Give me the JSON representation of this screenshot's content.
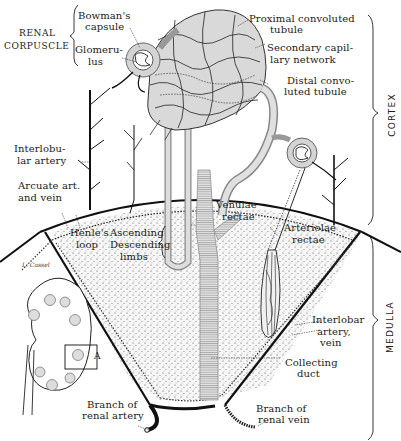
{
  "figure": {
    "labels": {
      "renal_corpuscle_1": "RENAL",
      "renal_corpuscle_2": "CORPUSCLE",
      "bowmans_capsule_1": "Bowman's",
      "bowmans_capsule_2": "capsule",
      "glomerulus_1": "Glomeru-",
      "glomerulus_2": "lus",
      "proximal_1": "Proximal convoluted",
      "proximal_2": "tubule",
      "secondary_1": "Secondary capil-",
      "secondary_2": "lary network",
      "distal_1": "Distal convo-",
      "distal_2": "luted tubule",
      "interlobular_1": "Interlobu-",
      "interlobular_2": "lar artery",
      "arcuate_1": "Arcuate art.",
      "arcuate_2": "and vein",
      "henles_1": "Henle's",
      "henles_2": "loop",
      "ascending": "Ascending",
      "descending": "Descending",
      "limbs": "limbs",
      "venulae_1": "Venulae",
      "venulae_2": "rectae",
      "arteriolae_1": "Arteriolae",
      "arteriolae_2": "rectae",
      "interlobar_1": "Interlobar",
      "interlobar_2": "artery,",
      "interlobar_3": "vein",
      "collecting_1": "Collecting",
      "collecting_2": "duct",
      "branch_artery_1": "Branch of",
      "branch_artery_2": "renal artery",
      "branch_vein_1": "Branch of",
      "branch_vein_2": "renal vein",
      "inset_marker": "A",
      "cortex": "CORTEX",
      "medulla": "MEDULLA",
      "signature": "L. Cassel"
    }
  }
}
